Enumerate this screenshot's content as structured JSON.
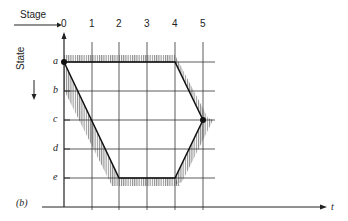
{
  "figure": {
    "panel_label": "(b)",
    "stage_label": "Stage",
    "state_label": "State",
    "time_label": "t",
    "stages": [
      "0",
      "1",
      "2",
      "3",
      "4",
      "5"
    ],
    "states": [
      "a",
      "b",
      "c",
      "d",
      "e"
    ],
    "path": [
      {
        "stage": 0,
        "state": "a"
      },
      {
        "stage": 4,
        "state": "a"
      },
      {
        "stage": 5,
        "state": "c"
      },
      {
        "stage": 4,
        "state": "e"
      },
      {
        "stage": 2,
        "state": "e"
      },
      {
        "stage": 0,
        "state": "a"
      }
    ],
    "marked_points": [
      {
        "stage": 0,
        "state": "a"
      },
      {
        "stage": 5,
        "state": "c"
      }
    ]
  }
}
